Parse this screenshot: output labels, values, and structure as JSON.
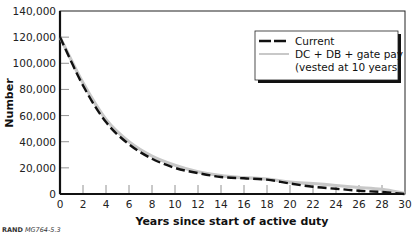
{
  "chart_data": {
    "type": "line",
    "title": "",
    "xlabel": "Years since start of active duty",
    "ylabel": "Number",
    "xlim": [
      0,
      30
    ],
    "ylim": [
      0,
      140000
    ],
    "x_ticks": [
      0,
      2,
      4,
      6,
      8,
      10,
      12,
      14,
      16,
      18,
      20,
      22,
      24,
      26,
      28,
      30
    ],
    "y_ticks": [
      0,
      20000,
      40000,
      60000,
      80000,
      100000,
      120000,
      140000
    ],
    "y_tick_labels": [
      "0",
      "20,000",
      "40,000",
      "60,000",
      "80,000",
      "100,000",
      "120,000",
      "140,000"
    ],
    "grid": false,
    "legend_position": "upper right (boxed with drop shadow)",
    "x": [
      0,
      2,
      4,
      6,
      8,
      10,
      12,
      14,
      16,
      18,
      20,
      22,
      24,
      26,
      28,
      30
    ],
    "series": [
      {
        "name": "Current",
        "style": "black dashed",
        "color": "#111111",
        "values": [
          120000,
          83000,
          55000,
          38000,
          27000,
          20000,
          16000,
          13000,
          12000,
          11000,
          8000,
          5500,
          4000,
          2500,
          1500,
          0
        ]
      },
      {
        "name": "DC + DB + gate pay (vested at 10 years)",
        "style": "light gray solid",
        "color": "#c8c8c8",
        "values": [
          120000,
          85000,
          57000,
          40000,
          29000,
          22000,
          17000,
          14000,
          12500,
          11500,
          9000,
          8000,
          6500,
          5000,
          3500,
          500
        ]
      }
    ]
  },
  "legend": {
    "items": [
      {
        "label": "Current"
      },
      {
        "label_line1": "DC + DB + gate pay",
        "label_line2": "(vested at 10 years)"
      }
    ]
  },
  "source": {
    "org": "RAND",
    "id": "MG764-5.3"
  }
}
